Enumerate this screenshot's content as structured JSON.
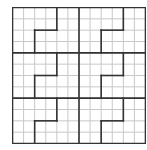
{
  "puzzle": {
    "type": "jigsaw-sudoku-grid",
    "cols": 12,
    "rows": 12,
    "box_cols": 6,
    "box_rows": 4,
    "boxes_across": 2,
    "boxes_down": 3,
    "cells_filled": 0
  },
  "colors": {
    "thin_line": "#c8c8c8",
    "thick_line": "#333333",
    "background": "#ffffff"
  },
  "region_pattern_within_box": [
    {
      "orientation": "vertical",
      "at_col": 4,
      "from_row": 0,
      "to_row": 2
    },
    {
      "orientation": "horizontal",
      "at_row": 2,
      "from_col": 2,
      "to_col": 4
    },
    {
      "orientation": "vertical",
      "at_col": 2,
      "from_row": 2,
      "to_row": 4
    }
  ]
}
